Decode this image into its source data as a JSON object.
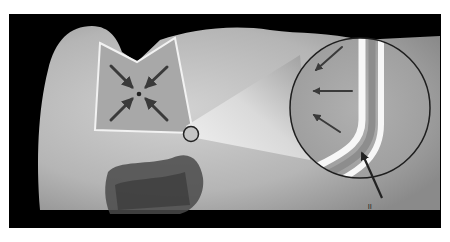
{
  "figure": {
    "background_color": "#000000",
    "page_color": "#ffffff",
    "tooth_color": "#b8b8b8",
    "restoration_color": "#a9a9a9",
    "outline_color": "#f2f2f2",
    "arrow_color": "#3a3a3a",
    "center_arrows": [
      "top-left",
      "top-right",
      "bottom-left",
      "bottom-right"
    ],
    "magnifier_arrows": [
      "upper",
      "middle",
      "lower"
    ],
    "pointer_label": "ll"
  }
}
